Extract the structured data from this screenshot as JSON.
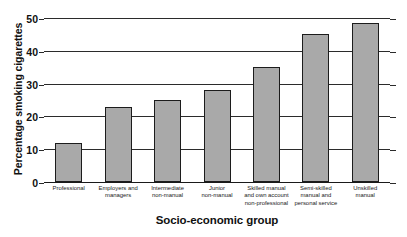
{
  "chart_data": {
    "type": "bar",
    "title": "",
    "xlabel": "Socio-economic group",
    "ylabel": "Percentage smoking cigarettes",
    "categories": [
      "Professional",
      "Employers and managers",
      "Intermediate non-manual",
      "Junior non-manual",
      "Skilled manual and own account non-professional",
      "Semi-skilled manual and personal service",
      "Unskilled manual"
    ],
    "category_lines": [
      [
        "Professional"
      ],
      [
        "Employers and",
        "managers"
      ],
      [
        "Intermediate",
        "non-manual"
      ],
      [
        "Junior",
        "non-manual"
      ],
      [
        "Skilled manual",
        "and own account",
        "non-professional"
      ],
      [
        "Semi-skilled",
        "manual and",
        "personal service"
      ],
      [
        "Unskilled",
        "manual"
      ]
    ],
    "values": [
      12,
      23,
      25,
      28,
      35,
      45,
      48.5
    ],
    "ylim": [
      0,
      50
    ],
    "yticks": [
      0,
      10,
      20,
      30,
      40,
      50
    ],
    "ytick_labels": [
      "0",
      "10",
      "20",
      "30",
      "40",
      "50"
    ],
    "grid": true,
    "legend": false,
    "bar_color": "#a9a9a9",
    "bar_edge_color": "#1c1c1c",
    "axis_color": "#2b2b2b",
    "background": "#ffffff"
  }
}
